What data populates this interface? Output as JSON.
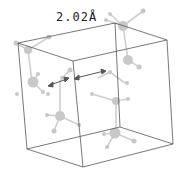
{
  "diagram": {
    "type": "crystal-unit-cell",
    "distance_label": "2.02Å",
    "colors": {
      "cell_edge": "#444444",
      "atom": "#c8c8c8",
      "bond": "#cccccc",
      "arrow": "#555555"
    }
  }
}
